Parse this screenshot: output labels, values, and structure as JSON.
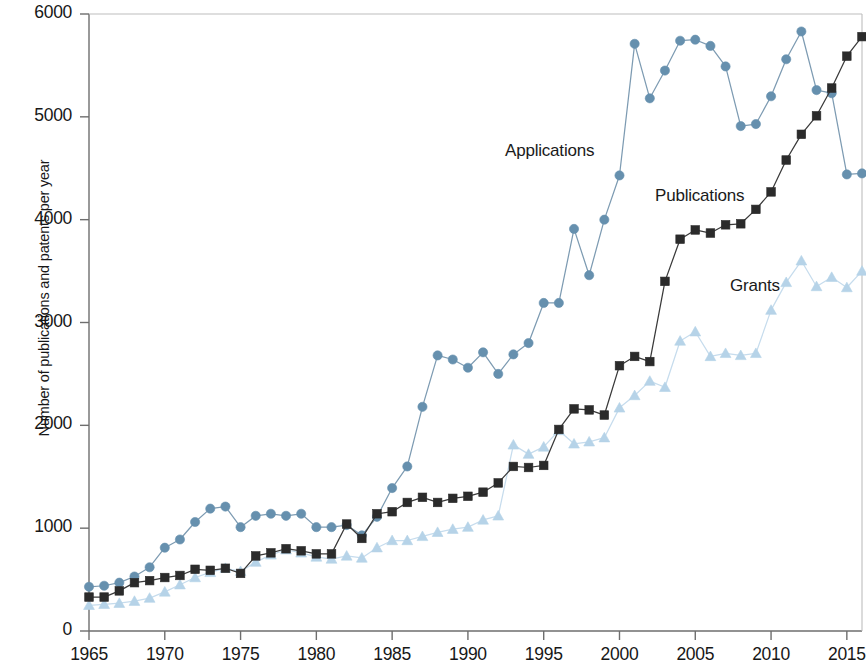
{
  "chart_data": {
    "type": "line",
    "title": "",
    "subtitle": "",
    "xlabel": "",
    "ylabel": "Number of publications and patents per year",
    "xlim": [
      1964.5,
      2016.5
    ],
    "ylim": [
      0,
      6000
    ],
    "xticks": [
      1965,
      1970,
      1975,
      1980,
      1985,
      1990,
      1995,
      2000,
      2005,
      2010,
      2015
    ],
    "yticks": [
      0,
      1000,
      2000,
      3000,
      4000,
      5000,
      6000
    ],
    "grid": false,
    "legend_position": "inline-annotations",
    "x": [
      1965,
      1966,
      1967,
      1968,
      1969,
      1970,
      1971,
      1972,
      1973,
      1974,
      1975,
      1976,
      1977,
      1978,
      1979,
      1980,
      1981,
      1982,
      1983,
      1984,
      1985,
      1986,
      1987,
      1988,
      1989,
      1990,
      1991,
      1992,
      1993,
      1994,
      1995,
      1996,
      1997,
      1998,
      1999,
      2000,
      2001,
      2002,
      2003,
      2004,
      2005,
      2006,
      2007,
      2008,
      2009,
      2010,
      2011,
      2012,
      2013,
      2014,
      2015,
      2016
    ],
    "series": [
      {
        "name": "Applications",
        "marker": "circle",
        "color": "#6690ae",
        "line_color": "#7d9bb2",
        "values": [
          430,
          440,
          470,
          530,
          620,
          810,
          890,
          1060,
          1190,
          1210,
          1010,
          1120,
          1140,
          1120,
          1140,
          1010,
          1010,
          1030,
          930,
          1110,
          1390,
          1600,
          2180,
          2680,
          2640,
          2560,
          2710,
          2500,
          2690,
          2800,
          3190,
          3190,
          3910,
          3460,
          4000,
          4430,
          5710,
          5180,
          5450,
          5740,
          5750,
          5690,
          5490,
          4910,
          4930,
          5200,
          5560,
          5830,
          5260,
          5230,
          4440,
          4450
        ]
      },
      {
        "name": "Publications",
        "marker": "square",
        "color": "#2b2b2b",
        "line_color": "#3a3a3a",
        "values": [
          330,
          330,
          390,
          470,
          490,
          520,
          540,
          600,
          590,
          610,
          560,
          730,
          760,
          800,
          780,
          750,
          750,
          1040,
          900,
          1140,
          1160,
          1250,
          1300,
          1250,
          1290,
          1310,
          1350,
          1440,
          1600,
          1590,
          1610,
          1960,
          2160,
          2150,
          2100,
          2580,
          2670,
          2620,
          3400,
          3810,
          3900,
          3870,
          3950,
          3960,
          4100,
          4270,
          4580,
          4830,
          5010,
          5280,
          5590,
          5780
        ]
      },
      {
        "name": "Grants",
        "marker": "triangle",
        "color": "#b6d3e8",
        "line_color": "#c6dced",
        "values": [
          250,
          260,
          270,
          290,
          320,
          380,
          450,
          520,
          570,
          610,
          580,
          670,
          740,
          790,
          760,
          720,
          700,
          730,
          710,
          810,
          880,
          880,
          920,
          960,
          990,
          1010,
          1080,
          1120,
          1810,
          1720,
          1790,
          1950,
          1820,
          1840,
          1880,
          2170,
          2290,
          2430,
          2370,
          2820,
          2910,
          2670,
          2700,
          2680,
          2700,
          3120,
          3390,
          3600,
          3350,
          3440,
          3340,
          3500
        ]
      }
    ]
  },
  "annotations": {
    "applications": "Applications",
    "publications": "Publications",
    "grants": "Grants"
  },
  "axis": {
    "y_title": "Number of publications and patents per year",
    "y_tick_labels": [
      "0",
      "1000",
      "2000",
      "3000",
      "4000",
      "5000",
      "6000"
    ],
    "x_tick_labels": [
      "1965",
      "1970",
      "1975",
      "1980",
      "1985",
      "1990",
      "1995",
      "2000",
      "2005",
      "2010",
      "2015"
    ]
  },
  "colors": {
    "applications": "#6690ae",
    "publications": "#2b2b2b",
    "grants": "#b6d3e8",
    "axis": "#6e6e6e",
    "text": "#1a1a1a"
  }
}
